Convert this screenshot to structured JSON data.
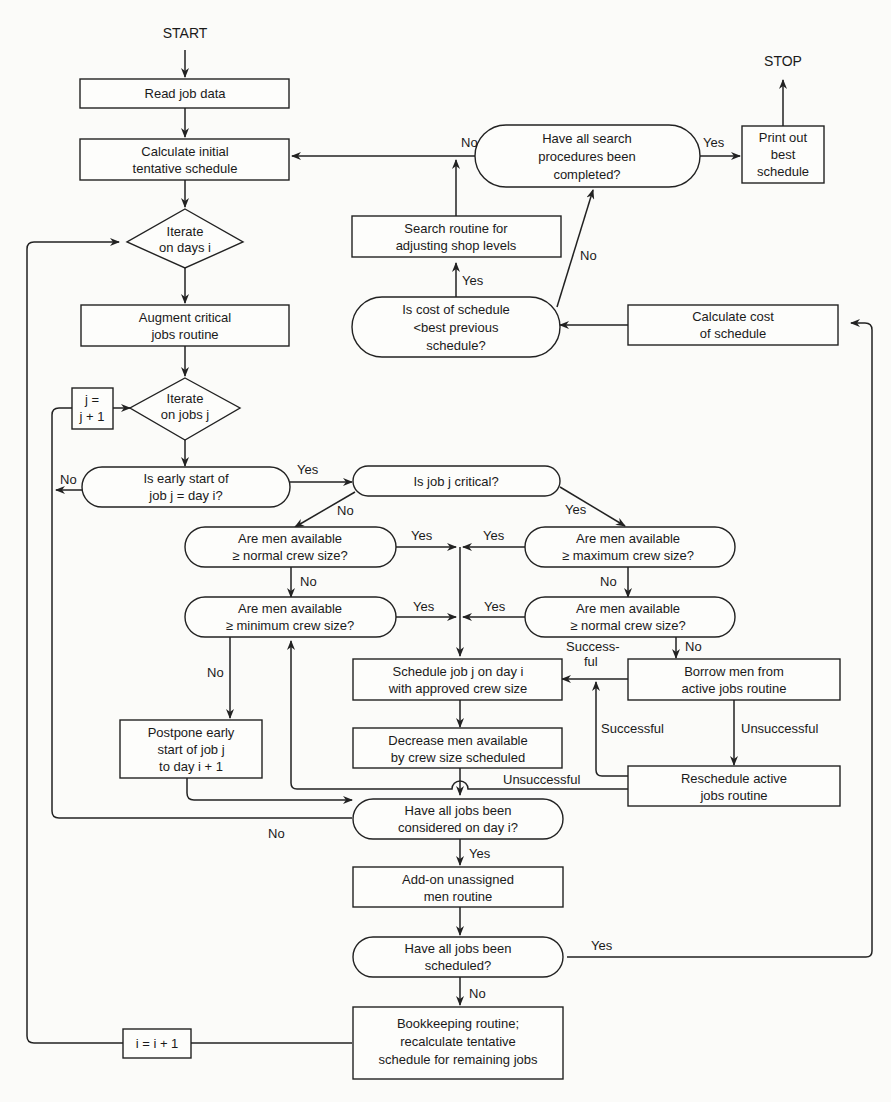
{
  "diagram": {
    "terminals": {
      "start": "START",
      "stop": "STOP"
    },
    "nodes": {
      "read_job_data": [
        "Read job data"
      ],
      "calc_initial": [
        "Calculate initial",
        "tentative schedule"
      ],
      "iterate_days": [
        "Iterate",
        "on days i"
      ],
      "augment_critical": [
        "Augment critical",
        "jobs routine"
      ],
      "iterate_jobs": [
        "Iterate",
        "on jobs j"
      ],
      "j_increment": [
        "j =",
        "j + 1"
      ],
      "early_start": [
        "Is early start of",
        "job j = day i?"
      ],
      "job_critical": [
        "Is job j critical?"
      ],
      "men_normal_left": [
        "Are men available",
        "≥ normal crew size?"
      ],
      "men_minimum": [
        "Are men available",
        "≥ minimum crew size?"
      ],
      "men_maximum": [
        "Are men available",
        "≥ maximum crew size?"
      ],
      "men_normal_right": [
        "Are men available",
        "≥ normal crew size?"
      ],
      "schedule_job": [
        "Schedule job j on day i",
        "with approved crew size"
      ],
      "decrease_men": [
        "Decrease men available",
        "by crew size scheduled"
      ],
      "borrow_men": [
        "Borrow men from",
        "active jobs routine"
      ],
      "reschedule_active": [
        "Reschedule active",
        "jobs routine"
      ],
      "postpone": [
        "Postpone early",
        "start of job j",
        "to day i + 1"
      ],
      "all_considered": [
        "Have all jobs been",
        "considered on day i?"
      ],
      "add_on": [
        "Add-on unassigned",
        "men routine"
      ],
      "all_scheduled": [
        "Have all jobs been",
        "scheduled?"
      ],
      "bookkeeping": [
        "Bookkeeping routine;",
        "recalculate tentative",
        "schedule for remaining jobs"
      ],
      "i_increment": [
        "i = i + 1"
      ],
      "search_complete": [
        "Have all search",
        "procedures been",
        "completed?"
      ],
      "print_best": [
        "Print out",
        "best",
        "schedule"
      ],
      "search_routine": [
        "Search routine for",
        "adjusting shop levels"
      ],
      "cost_less": [
        "Is cost of schedule",
        "<best previous",
        "schedule?"
      ],
      "calc_cost": [
        "Calculate cost",
        "of schedule"
      ]
    },
    "edge_labels": {
      "search_no": "No",
      "search_yes": "Yes",
      "cost_no": "No",
      "cost_yes": "Yes",
      "early_no": "No",
      "early_yes": "Yes",
      "critical_no": "No",
      "critical_yes": "Yes",
      "normal_left_yes": "Yes",
      "normal_left_no": "No",
      "maximum_yes": "Yes",
      "maximum_no": "No",
      "minimum_yes": "Yes",
      "minimum_no": "No",
      "normal_right_yes": "Yes",
      "normal_right_no": "No",
      "borrow_successful_1": "Success-",
      "borrow_successful_2": "ful",
      "borrow_unsuccessful": "Unsuccessful",
      "reschedule_successful": "Successful",
      "reschedule_unsuccessful": "Unsuccessful",
      "considered_no": "No",
      "considered_yes": "Yes",
      "scheduled_yes": "Yes",
      "scheduled_no": "No"
    }
  }
}
